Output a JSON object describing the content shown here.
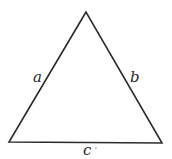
{
  "diagram": {
    "type": "triangle",
    "vertices": {
      "apex": [
        86,
        12
      ],
      "bottom_left": [
        9,
        142
      ],
      "bottom_right": [
        162,
        143
      ]
    },
    "sides": [
      {
        "id": "a",
        "label": "a",
        "between": [
          "bottom_left",
          "apex"
        ]
      },
      {
        "id": "b",
        "label": "b",
        "between": [
          "apex",
          "bottom_right"
        ]
      },
      {
        "id": "c",
        "label": "c",
        "between": [
          "bottom_left",
          "bottom_right"
        ]
      }
    ],
    "stroke_color": "#2b2b2b"
  }
}
